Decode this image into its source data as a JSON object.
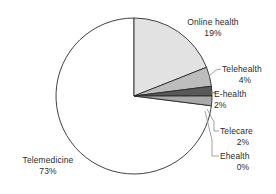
{
  "chart_data": {
    "type": "pie",
    "title": "",
    "subtitle": "",
    "xlabel": "",
    "ylabel": "",
    "legend_position": "none",
    "grid": false,
    "start_angle_deg": 0,
    "direction": "clockwise",
    "categories": [
      "Online health",
      "Telehealth",
      "E-health",
      "Telecare",
      "Ehealth",
      "Telemedicine"
    ],
    "values": [
      19,
      4,
      2,
      2,
      0,
      73
    ],
    "value_unit": "%",
    "slices": [
      {
        "label": "Online health",
        "value": 19,
        "value_text": "19%",
        "color": "#e2e2e2"
      },
      {
        "label": "Telehealth",
        "value": 4,
        "value_text": "4%",
        "color": "#bdbdbd"
      },
      {
        "label": "E-health",
        "value": 2,
        "value_text": "2%",
        "color": "#595959"
      },
      {
        "label": "Telecare",
        "value": 2,
        "value_text": "2%",
        "color": "#a8a8a8"
      },
      {
        "label": "Ehealth",
        "value": 0,
        "value_text": "0%",
        "color": "#d0d0d0"
      },
      {
        "label": "Telemedicine",
        "value": 73,
        "value_text": "73%",
        "color": "#ffffff"
      }
    ],
    "outline_color": "#2b2b2b",
    "background_color": "#ffffff"
  },
  "labels": {
    "online_health": {
      "name": "Online health",
      "value": "19%"
    },
    "telehealth": {
      "name": "Telehealth",
      "value": "4%"
    },
    "e_health": {
      "name": "E-health",
      "value": "2%"
    },
    "telecare": {
      "name": "Telecare",
      "value": "2%"
    },
    "ehealth": {
      "name": "Ehealth",
      "value": "0%"
    },
    "telemedicine": {
      "name": "Telemedicine",
      "value": "73%"
    }
  }
}
